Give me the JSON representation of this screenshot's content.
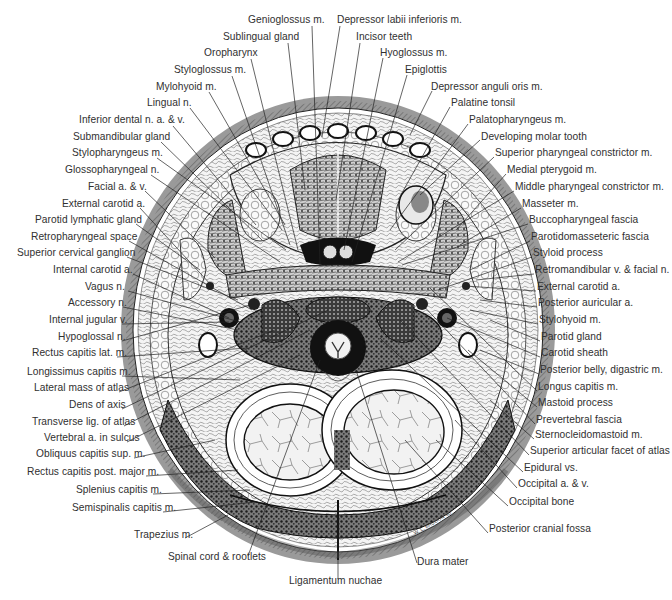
{
  "figure": {
    "type": "anatomical-cross-section",
    "signature": "W. L. Brudon '80",
    "colors": {
      "ink": "#1a1a1a",
      "label": "#303030",
      "background": "#ffffff",
      "skin_band": "#9a9a9a"
    }
  },
  "labels": {
    "top": [
      {
        "text": "Genioglossus m.",
        "x": 248,
        "y": 20
      },
      {
        "text": "Sublingual gland",
        "x": 223,
        "y": 37
      },
      {
        "text": "Oropharynx",
        "x": 204,
        "y": 53
      },
      {
        "text": "Styloglossus m.",
        "x": 174,
        "y": 70
      },
      {
        "text": "Mylohyoid m.",
        "x": 156,
        "y": 87
      },
      {
        "text": "Lingual n.",
        "x": 147,
        "y": 103
      },
      {
        "text": "Depressor labii inferioris m.",
        "x": 337,
        "y": 20
      },
      {
        "text": "Incisor teeth",
        "x": 356,
        "y": 37
      },
      {
        "text": "Hyoglossus m.",
        "x": 380,
        "y": 53
      },
      {
        "text": "Epiglottis",
        "x": 405,
        "y": 70
      }
    ],
    "left": [
      {
        "text": "Inferior dental n. a. & v.",
        "x": 79,
        "y": 120
      },
      {
        "text": "Submandibular gland",
        "x": 73,
        "y": 137
      },
      {
        "text": "Stylopharyngeus m.",
        "x": 72,
        "y": 153
      },
      {
        "text": "Glossopharyngeal n.",
        "x": 65,
        "y": 170
      },
      {
        "text": "Facial a. & v.",
        "x": 88,
        "y": 187
      },
      {
        "text": "External carotid a.",
        "x": 62,
        "y": 204
      },
      {
        "text": "Parotid lymphatic gland",
        "x": 35,
        "y": 220
      },
      {
        "text": "Retropharyngeal space",
        "x": 31,
        "y": 237
      },
      {
        "text": "Superior cervical ganglion",
        "x": 17,
        "y": 253
      },
      {
        "text": "Internal carotid a.",
        "x": 53,
        "y": 270
      },
      {
        "text": "Vagus n.",
        "x": 85,
        "y": 287
      },
      {
        "text": "Accessory n.",
        "x": 68,
        "y": 303
      },
      {
        "text": "Internal jugular v.",
        "x": 49,
        "y": 320
      },
      {
        "text": "Hypoglossal n.",
        "x": 58,
        "y": 337
      },
      {
        "text": "Rectus capitis lat. m.",
        "x": 32,
        "y": 353
      },
      {
        "text": "Longissimus capitis m.",
        "x": 27,
        "y": 372
      },
      {
        "text": "Lateral mass of atlas",
        "x": 34,
        "y": 388
      },
      {
        "text": "Dens of axis",
        "x": 69,
        "y": 405
      },
      {
        "text": "Transverse lig. of atlas",
        "x": 32,
        "y": 422
      },
      {
        "text": "Vertebral a. in sulcus",
        "x": 44,
        "y": 438
      },
      {
        "text": "Obliquus capitis sup. m.",
        "x": 36,
        "y": 454
      },
      {
        "text": "Rectus capitis post. major m.",
        "x": 27,
        "y": 472
      },
      {
        "text": "Splenius capitis m.",
        "x": 76,
        "y": 490
      },
      {
        "text": "Semispinalis capitis m.",
        "x": 72,
        "y": 508
      },
      {
        "text": "Trapezius m.",
        "x": 134,
        "y": 535
      }
    ],
    "right": [
      {
        "text": "Depressor anguli oris m.",
        "x": 431,
        "y": 87
      },
      {
        "text": "Palatine tonsil",
        "x": 451,
        "y": 103
      },
      {
        "text": "Palatopharyngeus m.",
        "x": 469,
        "y": 120
      },
      {
        "text": "Developing molar tooth",
        "x": 481,
        "y": 137
      },
      {
        "text": "Superior pharyngeal constrictor m.",
        "x": 495,
        "y": 153
      },
      {
        "text": "Medial pterygoid m.",
        "x": 507,
        "y": 170
      },
      {
        "text": "Middle pharyngeal constrictor m.",
        "x": 515,
        "y": 187
      },
      {
        "text": "Masseter m.",
        "x": 522,
        "y": 204
      },
      {
        "text": "Buccopharyngeal fascia",
        "x": 529,
        "y": 220
      },
      {
        "text": "Parotidomasseteric fascia",
        "x": 531,
        "y": 237
      },
      {
        "text": "Styloid process",
        "x": 533,
        "y": 253
      },
      {
        "text": "Retromandibular v. & facial n.",
        "x": 535,
        "y": 270
      },
      {
        "text": "External carotid a.",
        "x": 537,
        "y": 287
      },
      {
        "text": "Posterior auricular a.",
        "x": 538,
        "y": 303
      },
      {
        "text": "Stylohyoid m.",
        "x": 539,
        "y": 320
      },
      {
        "text": "Parotid gland",
        "x": 541,
        "y": 337
      },
      {
        "text": "Carotid sheath",
        "x": 541,
        "y": 353
      },
      {
        "text": "Posterior belly, digastric m.",
        "x": 540,
        "y": 370
      },
      {
        "text": "Longus capitis m.",
        "x": 538,
        "y": 387
      },
      {
        "text": "Mastoid process",
        "x": 538,
        "y": 403
      },
      {
        "text": "Prevertebral fascia",
        "x": 536,
        "y": 420
      },
      {
        "text": "Sternocleidomastoid m.",
        "x": 535,
        "y": 435
      },
      {
        "text": "Superior articular facet of atlas",
        "x": 530,
        "y": 451
      },
      {
        "text": "Epidural vs.",
        "x": 524,
        "y": 468
      },
      {
        "text": "Occipital a. & v.",
        "x": 518,
        "y": 484
      },
      {
        "text": "Occipital bone",
        "x": 509,
        "y": 502
      },
      {
        "text": "Posterior cranial fossa",
        "x": 489,
        "y": 529
      }
    ],
    "bottom": [
      {
        "text": "Spinal cord & rootlets",
        "x": 168,
        "y": 557
      },
      {
        "text": "Ligamentum nuchae",
        "x": 289,
        "y": 581
      },
      {
        "text": "Dura mater",
        "x": 417,
        "y": 562
      }
    ]
  }
}
